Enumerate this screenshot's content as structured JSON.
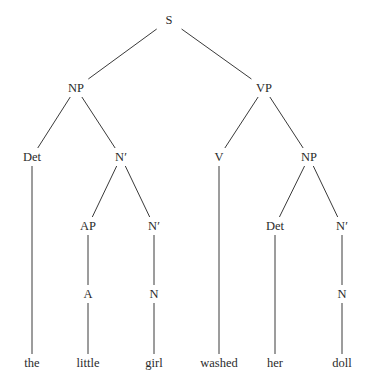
{
  "tree": {
    "nodes": [
      {
        "id": "s",
        "label": "S",
        "x": 169,
        "y": 20
      },
      {
        "id": "np1",
        "label": "NP",
        "x": 76,
        "y": 88
      },
      {
        "id": "vp",
        "label": "VP",
        "x": 264,
        "y": 88
      },
      {
        "id": "det1",
        "label": "Det",
        "x": 32,
        "y": 157
      },
      {
        "id": "nbar1",
        "label": "N′",
        "x": 121,
        "y": 157
      },
      {
        "id": "v",
        "label": "V",
        "x": 219,
        "y": 157
      },
      {
        "id": "np2",
        "label": "NP",
        "x": 309,
        "y": 157
      },
      {
        "id": "ap",
        "label": "AP",
        "x": 88,
        "y": 226
      },
      {
        "id": "nbar2",
        "label": "N′",
        "x": 154,
        "y": 226
      },
      {
        "id": "det2",
        "label": "Det",
        "x": 275,
        "y": 226
      },
      {
        "id": "nbar3",
        "label": "N′",
        "x": 342,
        "y": 226
      },
      {
        "id": "a",
        "label": "A",
        "x": 88,
        "y": 294
      },
      {
        "id": "n1",
        "label": "N",
        "x": 154,
        "y": 294
      },
      {
        "id": "n2",
        "label": "N",
        "x": 342,
        "y": 294
      },
      {
        "id": "w_the",
        "label": "the",
        "x": 32,
        "y": 363
      },
      {
        "id": "w_little",
        "label": "little",
        "x": 88,
        "y": 363
      },
      {
        "id": "w_girl",
        "label": "girl",
        "x": 154,
        "y": 363
      },
      {
        "id": "w_washed",
        "label": "washed",
        "x": 219,
        "y": 363
      },
      {
        "id": "w_her",
        "label": "her",
        "x": 275,
        "y": 363
      },
      {
        "id": "w_doll",
        "label": "doll",
        "x": 342,
        "y": 363
      }
    ],
    "edges": [
      [
        "s",
        "np1"
      ],
      [
        "s",
        "vp"
      ],
      [
        "np1",
        "det1"
      ],
      [
        "np1",
        "nbar1"
      ],
      [
        "vp",
        "v"
      ],
      [
        "vp",
        "np2"
      ],
      [
        "det1",
        "w_the"
      ],
      [
        "nbar1",
        "ap"
      ],
      [
        "nbar1",
        "nbar2"
      ],
      [
        "v",
        "w_washed"
      ],
      [
        "np2",
        "det2"
      ],
      [
        "np2",
        "nbar3"
      ],
      [
        "ap",
        "a"
      ],
      [
        "nbar2",
        "n1"
      ],
      [
        "det2",
        "w_her"
      ],
      [
        "nbar3",
        "n2"
      ],
      [
        "a",
        "w_little"
      ],
      [
        "n1",
        "w_girl"
      ],
      [
        "n2",
        "w_doll"
      ]
    ],
    "line_color": "#3a3a3a",
    "sentence": "the little girl washed her doll"
  }
}
